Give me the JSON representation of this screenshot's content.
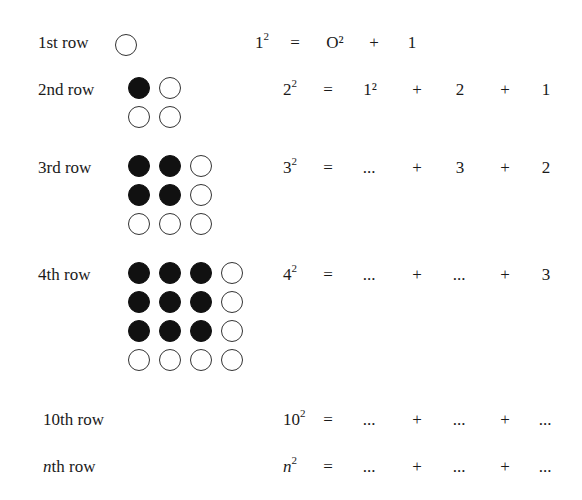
{
  "rows": [
    {
      "label": "1st row",
      "label_prefix": "",
      "label_suffix": "",
      "lhs_base": "1",
      "lhs_exp": "2",
      "terms": [
        "O²",
        "+",
        "1",
        "",
        ""
      ],
      "grid_n": 1
    },
    {
      "label": "2nd row",
      "lhs_base": "2",
      "lhs_exp": "2",
      "terms": [
        "1²",
        "+",
        "2",
        "+",
        "1"
      ],
      "grid_n": 2
    },
    {
      "label": "3rd row",
      "lhs_base": "3",
      "lhs_exp": "2",
      "terms": [
        "...",
        "+",
        "3",
        "+",
        "2"
      ],
      "grid_n": 3
    },
    {
      "label": "4th row",
      "lhs_base": "4",
      "lhs_exp": "2",
      "terms": [
        "...",
        "+",
        "...",
        "+",
        "3"
      ],
      "grid_n": 4
    },
    {
      "label": "10th row",
      "lhs_base": "10",
      "lhs_exp": "2",
      "terms": [
        "...",
        "+",
        "...",
        "+",
        "..."
      ],
      "grid_n": 0
    },
    {
      "label_italic": "n",
      "label_rest": "th row",
      "lhs_base": "n",
      "lhs_exp": "2",
      "terms": [
        "...",
        "+",
        "...",
        "+",
        "..."
      ],
      "grid_n": 0
    }
  ],
  "equals": "=",
  "colors": {
    "filled_dot": "#111111",
    "empty_dot_border": "#333333",
    "text": "#1a1a1a"
  }
}
